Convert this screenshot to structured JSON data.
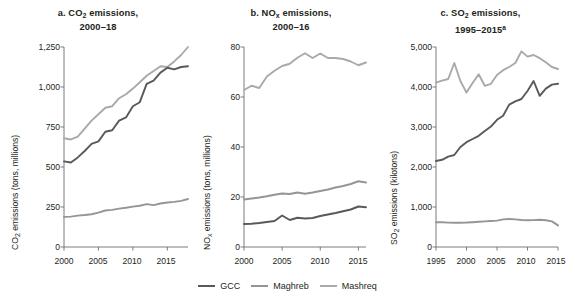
{
  "legend": {
    "position": "bottom-center",
    "items": [
      {
        "label": "GCC",
        "color": "#58595b"
      },
      {
        "label": "Maghreb",
        "color": "#939598"
      },
      {
        "label": "Mashreq",
        "color": "#a7a9ac"
      }
    ]
  },
  "chart_data": [
    {
      "type": "line",
      "panel": "a",
      "title_prefix": "a. CO",
      "title_sub": "2",
      "title_mid": " emissions,",
      "title_line2": "2000–18",
      "title": "a. CO2 emissions, 2000–18",
      "xlabel": "",
      "ylabel_prefix": "CO",
      "ylabel_sub": "2",
      "ylabel_rest": " emissions (tons, millions)",
      "ylabel": "CO2 emissions (tons, millions)",
      "grid": false,
      "xlim": [
        2000,
        2018
      ],
      "ylim": [
        0,
        1250
      ],
      "yticks": [
        0,
        250,
        500,
        750,
        1000,
        1250
      ],
      "ytick_labels": [
        "0",
        "250",
        "500",
        "750",
        "1,000",
        "1,250"
      ],
      "xticks": [
        2000,
        2005,
        2010,
        2015
      ],
      "xtick_labels": [
        "2000",
        "2005",
        "2010",
        "2015"
      ],
      "x": [
        2000,
        2001,
        2002,
        2003,
        2004,
        2005,
        2006,
        2007,
        2008,
        2009,
        2010,
        2011,
        2012,
        2013,
        2014,
        2015,
        2016,
        2017,
        2018
      ],
      "series": [
        {
          "name": "GCC",
          "color": "#58595b",
          "values": [
            535,
            528,
            560,
            600,
            645,
            660,
            720,
            730,
            790,
            810,
            880,
            905,
            1020,
            1040,
            1090,
            1120,
            1110,
            1125,
            1130
          ]
        },
        {
          "name": "Maghreb",
          "color": "#939598",
          "values": [
            188,
            190,
            196,
            200,
            205,
            215,
            228,
            232,
            240,
            245,
            252,
            258,
            268,
            262,
            272,
            278,
            282,
            288,
            300
          ]
        },
        {
          "name": "Mashreq",
          "color": "#a7a9ac",
          "values": [
            680,
            672,
            690,
            740,
            790,
            830,
            870,
            880,
            930,
            955,
            990,
            1030,
            1070,
            1100,
            1130,
            1125,
            1160,
            1200,
            1250
          ]
        }
      ]
    },
    {
      "type": "line",
      "panel": "b",
      "title_prefix": "b. NO",
      "title_sub": "x",
      "title_mid": " emissions,",
      "title_line2": "2000–16",
      "title": "b. NOx emissions, 2000–16",
      "xlabel": "",
      "ylabel_prefix": "NO",
      "ylabel_sub": "x",
      "ylabel_rest": " emissions (tons, millions)",
      "ylabel": "NOx emissions (tons, millions)",
      "grid": false,
      "xlim": [
        2000,
        2016
      ],
      "ylim": [
        0,
        80
      ],
      "yticks": [
        0,
        20,
        40,
        60,
        80
      ],
      "ytick_labels": [
        "0",
        "20",
        "40",
        "60",
        "80"
      ],
      "xticks": [
        2000,
        2005,
        2010,
        2015
      ],
      "xtick_labels": [
        "2000",
        "2005",
        "2010",
        "2015"
      ],
      "x": [
        2000,
        2001,
        2002,
        2003,
        2004,
        2005,
        2006,
        2007,
        2008,
        2009,
        2010,
        2011,
        2012,
        2013,
        2014,
        2015,
        2016
      ],
      "series": [
        {
          "name": "GCC",
          "color": "#58595b",
          "values": [
            9.2,
            9.3,
            9.6,
            10.0,
            10.4,
            12.6,
            10.8,
            11.7,
            11.4,
            11.6,
            12.4,
            13.0,
            13.6,
            14.3,
            15.0,
            16.2,
            15.9
          ]
        },
        {
          "name": "Maghreb",
          "color": "#939598",
          "values": [
            19.0,
            19.4,
            19.8,
            20.3,
            20.9,
            21.4,
            21.2,
            21.8,
            21.3,
            21.8,
            22.4,
            23.0,
            23.8,
            24.4,
            25.2,
            26.3,
            25.8
          ]
        },
        {
          "name": "Mashreq",
          "color": "#a7a9ac",
          "values": [
            62.8,
            64.5,
            63.6,
            68.2,
            70.5,
            72.4,
            73.3,
            75.7,
            77.5,
            75.6,
            77.4,
            75.6,
            75.6,
            75.2,
            74.2,
            72.7,
            73.8
          ]
        }
      ]
    },
    {
      "type": "line",
      "panel": "c",
      "title_prefix": "c. SO",
      "title_sub": "2",
      "title_mid": " emissions,",
      "title_line2": "1995–2015",
      "title_line2_sup": "a",
      "title": "c. SO2 emissions, 1995–2015a",
      "xlabel": "",
      "ylabel_prefix": "SO",
      "ylabel_sub": "2",
      "ylabel_rest": " emissions (kilotons)",
      "ylabel": "SO2 emissions (kilotons)",
      "grid": false,
      "xlim": [
        1995,
        2015
      ],
      "ylim": [
        0,
        5000
      ],
      "yticks": [
        0,
        1000,
        2000,
        3000,
        4000,
        5000
      ],
      "ytick_labels": [
        "0",
        "1,000",
        "2,000",
        "3,000",
        "4,000",
        "5,000"
      ],
      "xticks": [
        1995,
        2000,
        2005,
        2010,
        2015
      ],
      "xtick_labels": [
        "1995",
        "2000",
        "2005",
        "2010",
        "2015"
      ],
      "x": [
        1995,
        1996,
        1997,
        1998,
        1999,
        2000,
        2001,
        2002,
        2003,
        2004,
        2005,
        2006,
        2007,
        2008,
        2009,
        2010,
        2011,
        2012,
        2013,
        2014,
        2015
      ],
      "series": [
        {
          "name": "GCC",
          "color": "#58595b",
          "values": [
            2150,
            2180,
            2260,
            2300,
            2500,
            2620,
            2700,
            2780,
            2900,
            3010,
            3180,
            3280,
            3560,
            3640,
            3700,
            3900,
            4150,
            3780,
            3960,
            4060,
            4080
          ]
        },
        {
          "name": "Maghreb",
          "color": "#939598",
          "values": [
            620,
            618,
            610,
            605,
            608,
            612,
            620,
            630,
            640,
            650,
            660,
            690,
            700,
            690,
            675,
            670,
            672,
            680,
            670,
            640,
            540
          ]
        },
        {
          "name": "Mashreq",
          "color": "#a7a9ac",
          "values": [
            4110,
            4160,
            4200,
            4600,
            4150,
            3860,
            4100,
            4320,
            4030,
            4080,
            4300,
            4420,
            4500,
            4600,
            4890,
            4760,
            4800,
            4720,
            4620,
            4500,
            4450
          ]
        }
      ]
    }
  ]
}
